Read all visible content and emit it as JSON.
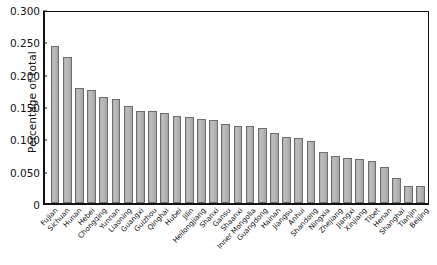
{
  "chart_data": {
    "type": "bar",
    "title": "",
    "xlabel": "",
    "ylabel": "Percentage of total",
    "ylim": [
      0,
      0.3
    ],
    "yticks": [
      "0",
      "0.050",
      "0.100",
      "0.150",
      "0.200",
      "0.250",
      "0.300"
    ],
    "ytick_values": [
      0,
      0.05,
      0.1,
      0.15,
      0.2,
      0.25,
      0.3
    ],
    "grid": false,
    "legend": "none",
    "categories": [
      "Fujian",
      "Sichuan",
      "Hunan",
      "Hebei",
      "Chongqing",
      "Yunnan",
      "Liaoning",
      "Guangxi",
      "Guizhou",
      "Qinghai",
      "Hubei",
      "Jilin",
      "Heilongjiang",
      "Shanxi",
      "Gansu",
      "Shaanxi",
      "Inner Mongolia",
      "Guangdong",
      "Hainan",
      "Jiangsu",
      "Anhui",
      "Shandong",
      "Ningxia",
      "Zhejiang",
      "Jiangxi",
      "Xinjiang",
      "Tibet",
      "Henan",
      "Shanghai",
      "Tianjin",
      "Beijing"
    ],
    "values": [
      0.245,
      0.228,
      0.179,
      0.177,
      0.165,
      0.163,
      0.151,
      0.144,
      0.143,
      0.141,
      0.136,
      0.135,
      0.132,
      0.13,
      0.123,
      0.12,
      0.12,
      0.117,
      0.11,
      0.103,
      0.102,
      0.097,
      0.08,
      0.074,
      0.071,
      0.068,
      0.066,
      0.056,
      0.039,
      0.027,
      0.026
    ],
    "bar_color": "#b3b3b3",
    "bar_edge_color": "#6e6e6e",
    "axis_color": "#111111",
    "background_color": "#ffffff"
  }
}
